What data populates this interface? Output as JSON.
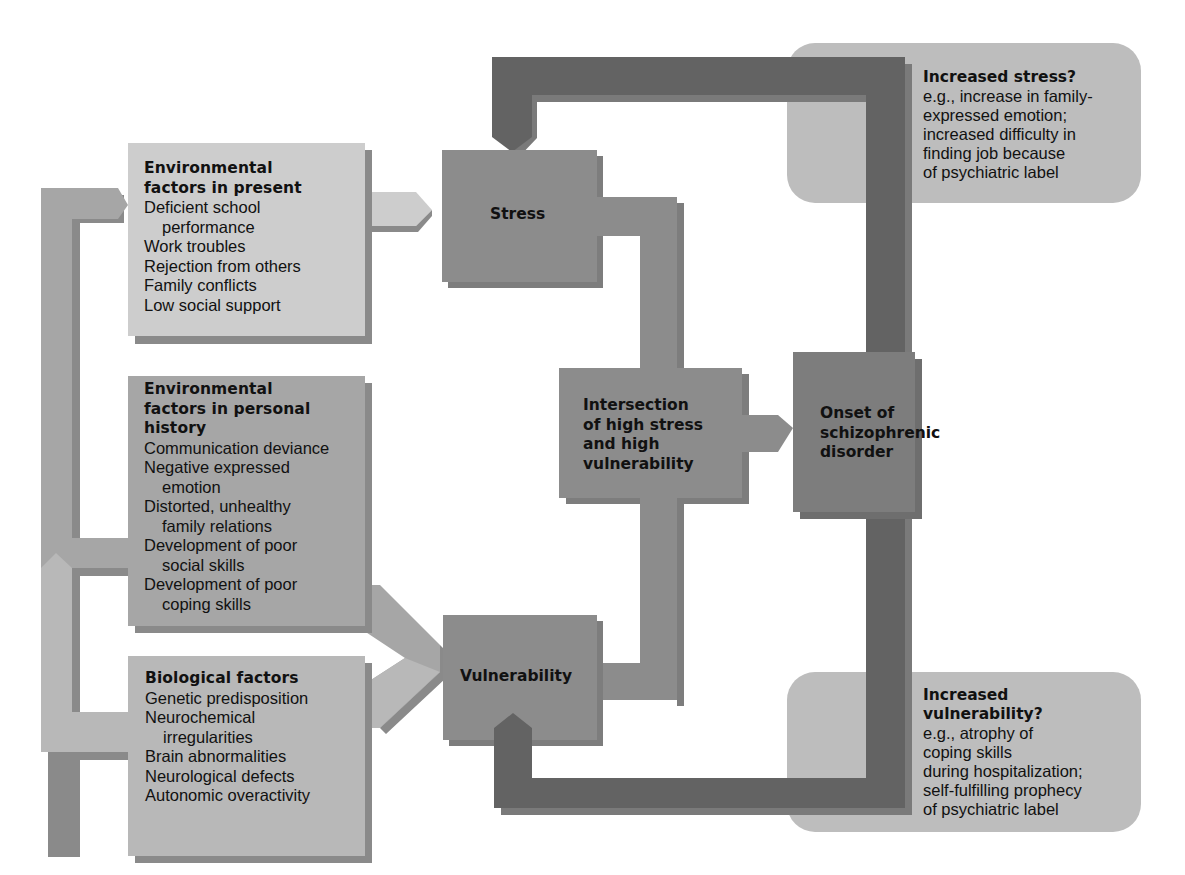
{
  "diagram": {
    "colors": {
      "light_box": "#cdcdcd",
      "mid_box": "#a6a6a6",
      "dark_node": "#8a8a8a",
      "darker_node": "#7a7a7a",
      "feedback_bar": "#636363",
      "note_bg": "#bdbdbd",
      "shadow": "#808080"
    },
    "factors": {
      "present": {
        "title_line1": "Environmental",
        "title_line2": "factors in present",
        "items": [
          "Deficient school",
          "performance",
          "Work troubles",
          "Rejection from others",
          "Family conflicts",
          "Low social support"
        ]
      },
      "history": {
        "title_line1": "Environmental",
        "title_line2": "factors in personal",
        "title_line3": "history",
        "items": [
          "Communication deviance",
          "Negative expressed",
          "emotion",
          "Distorted, unhealthy",
          "family relations",
          "Development of poor",
          "social skills",
          "Development of poor",
          "coping skills"
        ]
      },
      "biological": {
        "title": "Biological factors",
        "items": [
          "Genetic predisposition",
          "Neurochemical",
          "irregularities",
          "Brain abnormalities",
          "Neurological defects",
          "Autonomic overactivity"
        ]
      }
    },
    "nodes": {
      "stress": "Stress",
      "vulnerability": "Vulnerability",
      "intersection": [
        "Intersection",
        "of high stress",
        "and high",
        "vulnerability"
      ],
      "onset": [
        "Onset of",
        "schizophrenic",
        "disorder"
      ]
    },
    "notes": {
      "increased_stress": {
        "title": "Increased stress?",
        "lines": [
          "e.g., increase in family-",
          "expressed emotion;",
          "increased difficulty in",
          "finding job because",
          "of psychiatric label"
        ]
      },
      "increased_vulnerability": {
        "title_line1": "Increased",
        "title_line2": "vulnerability?",
        "lines": [
          "e.g., atrophy of",
          "coping skills",
          "during hospitalization;",
          "self-fulfilling prophecy",
          "of psychiatric label"
        ]
      }
    }
  }
}
